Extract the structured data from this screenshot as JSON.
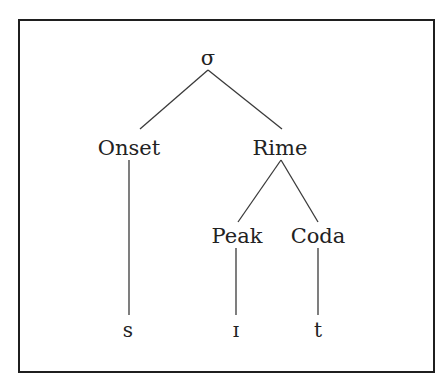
{
  "diagram": {
    "type": "syllable-structure-tree",
    "root": {
      "label": "σ"
    },
    "nodes": {
      "onset": "Onset",
      "rime": "Rime",
      "peak": "Peak",
      "coda": "Coda"
    },
    "segments": {
      "onset_segment": "s",
      "peak_segment": "ɪ",
      "coda_segment": "t"
    },
    "edges": [
      [
        "σ",
        "Onset"
      ],
      [
        "σ",
        "Rime"
      ],
      [
        "Rime",
        "Peak"
      ],
      [
        "Rime",
        "Coda"
      ],
      [
        "Onset",
        "s"
      ],
      [
        "Peak",
        "ɪ"
      ],
      [
        "Coda",
        "t"
      ]
    ],
    "colors": {
      "line": "#3a3a3a",
      "text": "#222222",
      "border": "#1f1f1f"
    }
  }
}
